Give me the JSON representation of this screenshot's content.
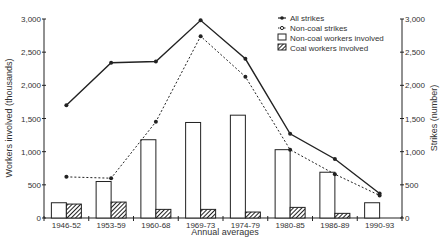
{
  "chart_data": {
    "type": "bar",
    "title": "",
    "xlabel": "Annual averages",
    "ylabel": "Workers involved (thousands)",
    "y2label": "Strikes (number)",
    "ylim": [
      0,
      3000
    ],
    "y2lim": [
      0,
      3000
    ],
    "yticks": [
      "0",
      "500",
      "1,000",
      "1,500",
      "2,000",
      "2,500",
      "3,000"
    ],
    "categories": [
      "1946-52",
      "1953-59",
      "1960-68",
      "1969-73",
      "1974-79",
      "1980-85",
      "1986-89",
      "1990-93"
    ],
    "series": [
      {
        "name": "All strikes",
        "type": "line",
        "axis": "right",
        "style": "solid",
        "values": [
          1700,
          2340,
          2360,
          2980,
          2400,
          1270,
          890,
          370
        ]
      },
      {
        "name": "Non-coal strikes",
        "type": "line",
        "axis": "right",
        "style": "dashed",
        "values": [
          620,
          600,
          1450,
          2740,
          2130,
          1030,
          660,
          340
        ]
      },
      {
        "name": "Non-coal workers involved",
        "type": "bar",
        "axis": "left",
        "fill": "white",
        "values": [
          230,
          550,
          1180,
          1440,
          1550,
          1030,
          690,
          230
        ]
      },
      {
        "name": "Coal workers involved",
        "type": "bar",
        "axis": "left",
        "fill": "hatched",
        "values": [
          210,
          240,
          130,
          130,
          90,
          160,
          70,
          0
        ]
      }
    ],
    "legend_position": "top-right",
    "grid": false
  },
  "legend": [
    {
      "label": "All strikes"
    },
    {
      "label": "Non-coal strikes"
    },
    {
      "label": "Non-coal workers involved"
    },
    {
      "label": "Coal workers involved"
    }
  ]
}
